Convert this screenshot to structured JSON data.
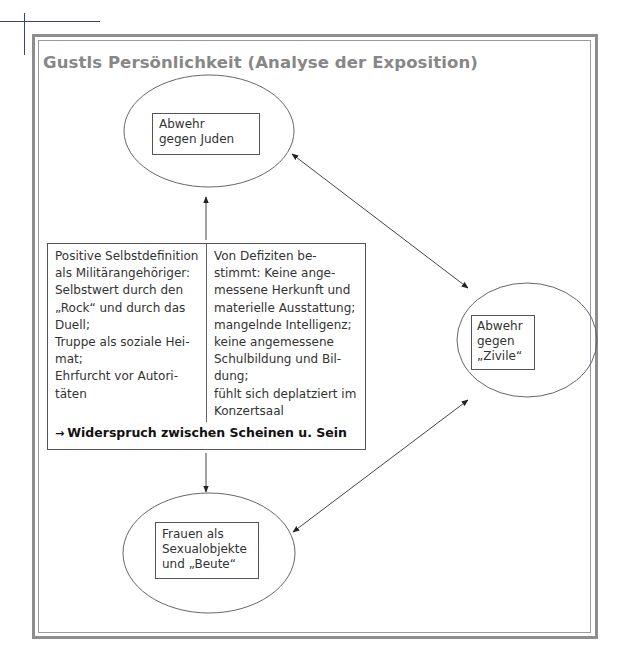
{
  "page": {
    "title": "Gustls Persönlichkeit (Analyse der Exposition)",
    "colors": {
      "title": "#878787",
      "frame": "#8e8e8e",
      "crop_mark": "#3a3f8a",
      "lines": "#555555"
    }
  },
  "nodes": {
    "top": {
      "lines": [
        "Abwehr",
        "gegen Juden"
      ]
    },
    "right": {
      "lines": [
        "Abwehr",
        "gegen",
        "„Zivile“"
      ]
    },
    "bottom": {
      "lines": [
        "Frauen als",
        "Sexualobjekte",
        "und „Beute“"
      ]
    }
  },
  "center_box": {
    "left_column": [
      "Positive Selbstdefinition",
      "als Militärangehöriger:",
      "Selbstwert durch den",
      "„Rock“ und durch das",
      "Duell;",
      "Truppe als soziale Hei-",
      "mat;",
      "Ehrfurcht vor Autori-",
      "täten"
    ],
    "right_column": [
      "Von Defiziten be-",
      "stimmt: Keine ange-",
      "messene Herkunft und",
      "materielle Ausstattung;",
      "mangelnde Intelligenz;",
      "keine angemessene",
      "Schulbildung und Bil-",
      "dung;",
      "fühlt sich deplatziert im",
      "Konzertsaal"
    ],
    "conclusion_arrow": "→",
    "conclusion": "Widerspruch zwischen Scheinen u. Sein"
  },
  "connections": [
    {
      "from": "center_box",
      "to": "top",
      "type": "arrow"
    },
    {
      "from": "center_box",
      "to": "bottom",
      "type": "arrow"
    },
    {
      "from": "top",
      "to": "right",
      "type": "double-arrow"
    },
    {
      "from": "bottom",
      "to": "right",
      "type": "double-arrow"
    }
  ]
}
